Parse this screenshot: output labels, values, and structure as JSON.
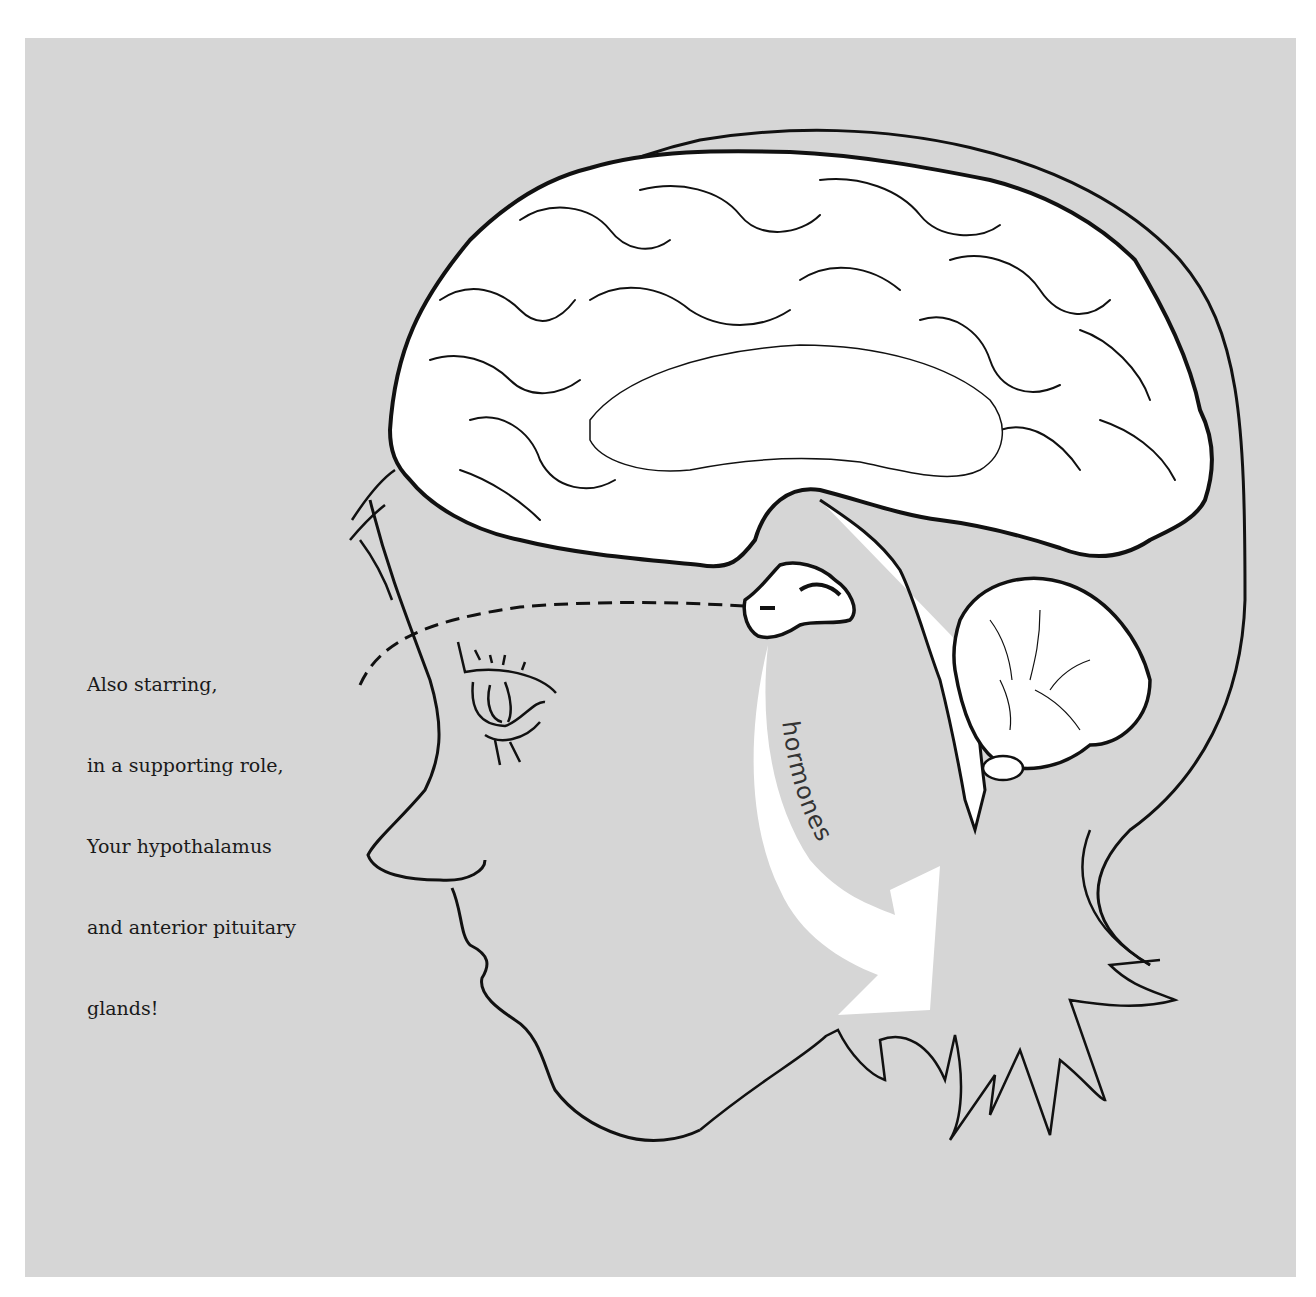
{
  "figure": {
    "background_color": "#d6d6d6",
    "line_color": "#111111",
    "fill_color": "#ffffff",
    "caption": {
      "lines": [
        "Also starring,",
        "in a supporting role,",
        "Your hypothalamus",
        "and anterior pituitary",
        "glands!"
      ]
    },
    "arrow": {
      "label": "hormones"
    }
  }
}
